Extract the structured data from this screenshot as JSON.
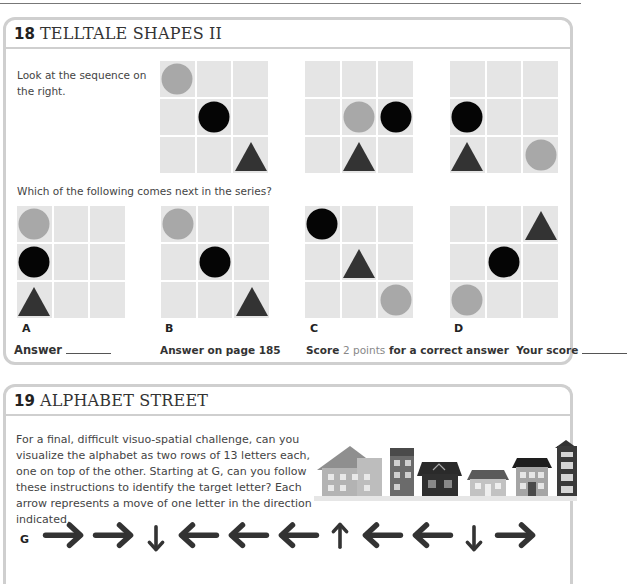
{
  "puzzle18": {
    "number": "18",
    "title": "TELLTALE SHAPES II",
    "intro": "Look at the sequence on the right.",
    "question": "Which of the following comes next in the series?",
    "sequence": [
      {
        "cells": [
          "grey-circle",
          "",
          "",
          "",
          "black-circle",
          "",
          "",
          "",
          "triangle"
        ]
      },
      {
        "cells": [
          "",
          "",
          "",
          "",
          "grey-circle",
          "black-circle",
          "",
          "triangle",
          ""
        ]
      },
      {
        "cells": [
          "",
          "",
          "",
          "black-circle",
          "",
          "",
          "triangle",
          "",
          "grey-circle"
        ]
      }
    ],
    "options": [
      {
        "label": "A",
        "cells": [
          "grey-circle",
          "",
          "",
          "black-circle",
          "",
          "",
          "triangle",
          "",
          ""
        ]
      },
      {
        "label": "B",
        "cells": [
          "grey-circle",
          "",
          "",
          "",
          "black-circle",
          "",
          "",
          "",
          "triangle"
        ]
      },
      {
        "label": "C",
        "cells": [
          "black-circle",
          "",
          "",
          "",
          "triangle",
          "",
          "",
          "",
          "grey-circle"
        ]
      },
      {
        "label": "D",
        "cells": [
          "",
          "",
          "triangle",
          "",
          "black-circle",
          "",
          "grey-circle",
          "",
          ""
        ]
      }
    ],
    "answer_label": "Answer",
    "answer_page": "Answer on page 185",
    "score_prefix": "Score",
    "score_points": "2 points",
    "score_suffix": "for a correct answer",
    "your_score_label": "Your score"
  },
  "puzzle19": {
    "number": "19",
    "title": "ALPHABET STREET",
    "body": "For a final, difficult visuo-spatial challenge, can you visualize the alphabet as two rows of 13 letters each, one on top of the other. Starting at G, can you follow these instructions to identify the target letter? Each arrow represents a move of one letter in the direction indicated.",
    "start_letter": "G",
    "arrows": [
      "right",
      "right",
      "down",
      "left",
      "left",
      "left",
      "up",
      "left",
      "left",
      "down",
      "right"
    ],
    "illustration": "houses-street"
  },
  "colors": {
    "cell": "#e5e5e5",
    "grey_circle": "#a8a8a8",
    "black_circle": "#050505",
    "triangle": "#333333",
    "accent_points": "#888888",
    "panel_border": "#cfcfcf"
  }
}
